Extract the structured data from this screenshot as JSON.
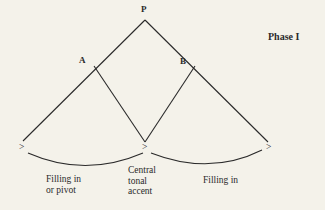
{
  "diagram": {
    "phase_label": "Phase I",
    "nodes": {
      "top": "P",
      "left": "A",
      "right": "B"
    },
    "accent_marks": [
      ">",
      ">",
      ">"
    ],
    "annotations": {
      "left_span": [
        "Filling in",
        "or pivot"
      ],
      "center": [
        "Central",
        "tonal",
        "accent"
      ],
      "right_span": [
        "Filling in"
      ]
    },
    "colors": {
      "background": "#f4f2ea",
      "ink": "#2a2a2a"
    }
  }
}
